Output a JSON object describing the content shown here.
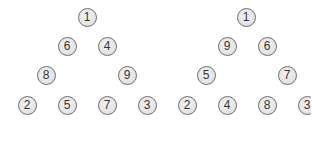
{
  "trees": [
    {
      "name": "left-tree",
      "nodes": [
        {
          "label": "1",
          "x": 87,
          "y": 17
        },
        {
          "label": "6",
          "x": 67,
          "y": 46
        },
        {
          "label": "4",
          "x": 107,
          "y": 46
        },
        {
          "label": "8",
          "x": 46,
          "y": 75
        },
        {
          "label": "9",
          "x": 127,
          "y": 75
        },
        {
          "label": "2",
          "x": 27,
          "y": 105
        },
        {
          "label": "5",
          "x": 67,
          "y": 105
        },
        {
          "label": "7",
          "x": 107,
          "y": 105
        },
        {
          "label": "3",
          "x": 147,
          "y": 105
        }
      ]
    },
    {
      "name": "right-tree",
      "nodes": [
        {
          "label": "1",
          "x": 246,
          "y": 17
        },
        {
          "label": "9",
          "x": 227,
          "y": 46
        },
        {
          "label": "6",
          "x": 267,
          "y": 46
        },
        {
          "label": "5",
          "x": 206,
          "y": 75
        },
        {
          "label": "7",
          "x": 287,
          "y": 75
        },
        {
          "label": "2",
          "x": 187,
          "y": 105
        },
        {
          "label": "4",
          "x": 227,
          "y": 105
        },
        {
          "label": "8",
          "x": 267,
          "y": 105
        },
        {
          "label": "3",
          "x": 307,
          "y": 105
        }
      ]
    }
  ],
  "colors": {
    "node_fill": "#e2e2e2",
    "node_border": "#6e6e6e",
    "text": "#333333",
    "background": "#ffffff"
  }
}
